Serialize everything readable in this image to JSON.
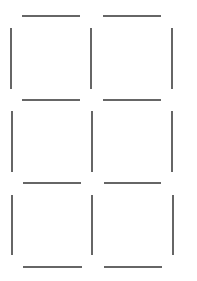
{
  "diagram": {
    "stroke_color": "#333333",
    "stroke_width": 1.5,
    "horizontal_segments": [
      {
        "x1": 22,
        "x2": 80,
        "y": 16
      },
      {
        "x1": 103,
        "x2": 161,
        "y": 16
      },
      {
        "x1": 22,
        "x2": 80,
        "y": 100
      },
      {
        "x1": 103,
        "x2": 161,
        "y": 100
      },
      {
        "x1": 23,
        "x2": 81,
        "y": 183
      },
      {
        "x1": 104,
        "x2": 161,
        "y": 183
      },
      {
        "x1": 23,
        "x2": 82,
        "y": 267
      },
      {
        "x1": 104,
        "x2": 162,
        "y": 267
      }
    ],
    "vertical_segments": [
      {
        "x": 11,
        "y1": 28,
        "y2": 89
      },
      {
        "x": 91,
        "y1": 28,
        "y2": 89
      },
      {
        "x": 172,
        "y1": 28,
        "y2": 89
      },
      {
        "x": 12,
        "y1": 111,
        "y2": 172
      },
      {
        "x": 92,
        "y1": 111,
        "y2": 172
      },
      {
        "x": 172,
        "y1": 111,
        "y2": 172
      },
      {
        "x": 12,
        "y1": 195,
        "y2": 255
      },
      {
        "x": 92,
        "y1": 195,
        "y2": 255
      },
      {
        "x": 173,
        "y1": 195,
        "y2": 255
      }
    ]
  }
}
